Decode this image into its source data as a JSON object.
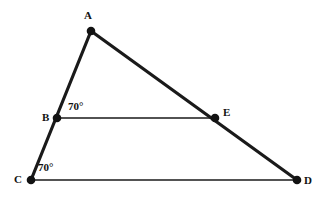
{
  "figure": {
    "type": "geometry-diagram",
    "background_color": "#ffffff",
    "stroke_color": "#1a1a1a",
    "canvas": {
      "width": 328,
      "height": 201
    },
    "points": [
      {
        "id": "A",
        "label": "A",
        "x": 91,
        "y": 31,
        "label_x": 84,
        "label_y": 10
      },
      {
        "id": "B",
        "label": "B",
        "x": 57,
        "y": 118,
        "label_x": 42,
        "label_y": 112
      },
      {
        "id": "C",
        "label": "C",
        "x": 31,
        "y": 180,
        "label_x": 14,
        "label_y": 174
      },
      {
        "id": "D",
        "label": "D",
        "x": 297,
        "y": 180,
        "label_x": 304,
        "label_y": 175
      },
      {
        "id": "E",
        "label": "E",
        "x": 215,
        "y": 118,
        "label_x": 223,
        "label_y": 107
      }
    ],
    "segments": [
      {
        "id": "A-C",
        "from": "A",
        "to": "C",
        "style": "thick",
        "width": 3.2
      },
      {
        "id": "A-D",
        "from": "A",
        "to": "D",
        "style": "thick",
        "width": 3.2
      },
      {
        "id": "B-E",
        "from": "B",
        "to": "E",
        "style": "thin",
        "width": 1.4
      },
      {
        "id": "C-D",
        "from": "C",
        "to": "D",
        "style": "thin",
        "width": 1.6
      }
    ],
    "angles": [
      {
        "id": "angle-at-B",
        "vertex": "B",
        "value": "70°",
        "label_x": 68,
        "label_y": 101
      },
      {
        "id": "angle-at-C",
        "vertex": "C",
        "value": "70°",
        "label_x": 38,
        "label_y": 162
      }
    ],
    "point_marker_radius": 4.2
  }
}
